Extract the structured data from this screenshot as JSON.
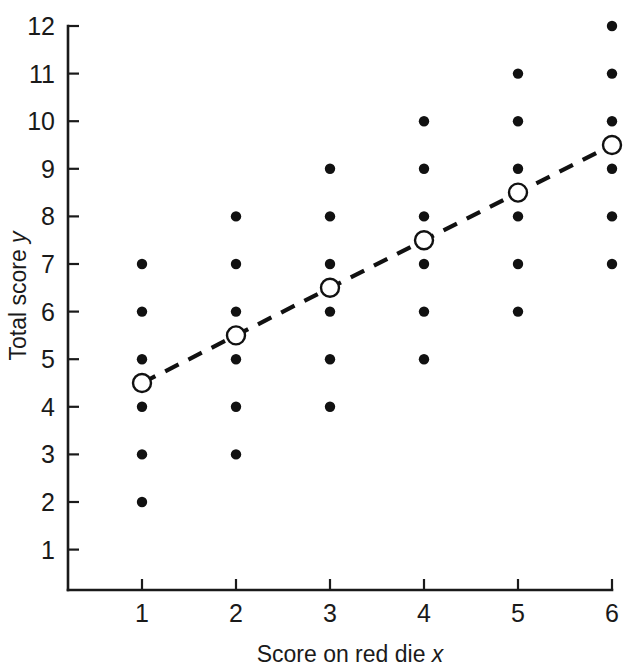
{
  "chart_data": {
    "type": "scatter",
    "title": "",
    "xlabel": "Score on red die x",
    "ylabel": "Total score y",
    "xlabel_plain": "Score on red die",
    "xlabel_italic": "x",
    "ylabel_plain": "Total score",
    "ylabel_italic": "y",
    "xlim": [
      0.55,
      6.42
    ],
    "ylim": [
      0.3,
      12.45
    ],
    "xticks": [
      1,
      2,
      3,
      4,
      5,
      6
    ],
    "yticks": [
      1,
      2,
      3,
      4,
      5,
      6,
      7,
      8,
      9,
      10,
      11,
      12
    ],
    "xtick_labels": [
      "1",
      "2",
      "3",
      "4",
      "5",
      "6"
    ],
    "ytick_labels": [
      "1",
      "2",
      "3",
      "4",
      "5",
      "6",
      "7",
      "8",
      "9",
      "10",
      "11",
      "12"
    ],
    "grid": false,
    "legend": null,
    "series": [
      {
        "name": "Observed totals",
        "marker": "filled-circle",
        "color": "#111111",
        "points": [
          {
            "x": 1,
            "y": 2
          },
          {
            "x": 1,
            "y": 3
          },
          {
            "x": 1,
            "y": 4
          },
          {
            "x": 1,
            "y": 5
          },
          {
            "x": 1,
            "y": 6
          },
          {
            "x": 1,
            "y": 7
          },
          {
            "x": 2,
            "y": 3
          },
          {
            "x": 2,
            "y": 4
          },
          {
            "x": 2,
            "y": 5
          },
          {
            "x": 2,
            "y": 6
          },
          {
            "x": 2,
            "y": 7
          },
          {
            "x": 2,
            "y": 8
          },
          {
            "x": 3,
            "y": 4
          },
          {
            "x": 3,
            "y": 5
          },
          {
            "x": 3,
            "y": 6
          },
          {
            "x": 3,
            "y": 7
          },
          {
            "x": 3,
            "y": 8
          },
          {
            "x": 3,
            "y": 9
          },
          {
            "x": 4,
            "y": 5
          },
          {
            "x": 4,
            "y": 6
          },
          {
            "x": 4,
            "y": 7
          },
          {
            "x": 4,
            "y": 8
          },
          {
            "x": 4,
            "y": 9
          },
          {
            "x": 4,
            "y": 10
          },
          {
            "x": 5,
            "y": 6
          },
          {
            "x": 5,
            "y": 7
          },
          {
            "x": 5,
            "y": 8
          },
          {
            "x": 5,
            "y": 9
          },
          {
            "x": 5,
            "y": 10
          },
          {
            "x": 5,
            "y": 11
          },
          {
            "x": 6,
            "y": 7
          },
          {
            "x": 6,
            "y": 8
          },
          {
            "x": 6,
            "y": 9
          },
          {
            "x": 6,
            "y": 10
          },
          {
            "x": 6,
            "y": 11
          },
          {
            "x": 6,
            "y": 12
          }
        ]
      },
      {
        "name": "Conditional mean of y given x",
        "marker": "open-circle",
        "color": "#111111",
        "line_style": "dashed",
        "points": [
          {
            "x": 1,
            "y": 4.5
          },
          {
            "x": 2,
            "y": 5.5
          },
          {
            "x": 3,
            "y": 6.5
          },
          {
            "x": 4,
            "y": 7.5
          },
          {
            "x": 5,
            "y": 8.5
          },
          {
            "x": 6,
            "y": 9.5
          }
        ]
      }
    ]
  },
  "colors": {
    "ink": "#111111",
    "axis": "#1a1a1a",
    "background": "#ffffff"
  }
}
